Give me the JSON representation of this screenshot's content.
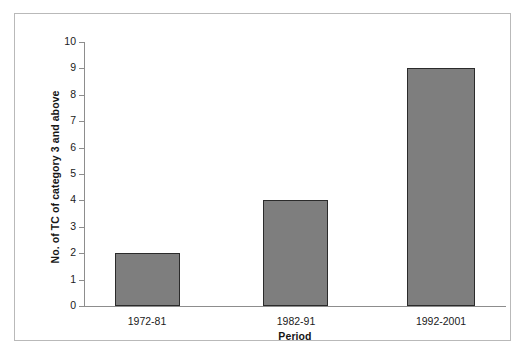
{
  "chart_data": {
    "type": "bar",
    "title": "",
    "categories": [
      "1972-81",
      "1982-91",
      "1992-2001"
    ],
    "values": [
      2,
      4,
      9
    ],
    "series": [
      {
        "name": "No. of TC of category 3 and above",
        "values": [
          2,
          4,
          9
        ]
      }
    ],
    "xlabel": "Period",
    "ylabel": "No. of TC of category 3 and above",
    "ylim": [
      0,
      10
    ],
    "yticks": [
      0,
      1,
      2,
      3,
      4,
      5,
      6,
      7,
      8,
      9,
      10
    ],
    "ytick_labels": [
      "0",
      "1",
      "2",
      "3",
      "4",
      "5",
      "6",
      "7",
      "8",
      "9",
      "10"
    ],
    "grid": false,
    "legend": false,
    "bar_fill_color": "#7e7e7e",
    "bar_edge_color": "#2b2b2b",
    "axis_color": "#8d8d8d",
    "frame_color": "#b9b9b9",
    "background_color": "#ffffff"
  }
}
